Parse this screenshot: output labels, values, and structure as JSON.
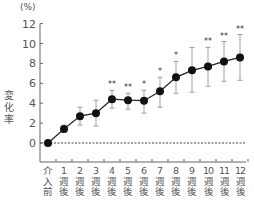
{
  "chart_data": {
    "type": "line",
    "title": "",
    "ylabel": "変化率",
    "yunit": "(%)",
    "xlabel": "",
    "ylim": [
      -1.9,
      12
    ],
    "yticks": [
      0,
      2,
      4,
      6,
      8,
      10,
      12
    ],
    "grid": false,
    "reference_line": {
      "y": 0,
      "style": "dotted"
    },
    "categories": [
      "介入前",
      "1週後",
      "2週後",
      "3週後",
      "4週後",
      "5週後",
      "6週後",
      "7週後",
      "8週後",
      "9週後",
      "10週後",
      "11週後",
      "12週後"
    ],
    "category_labels": [
      {
        "top": "介",
        "mid": "入",
        "bot": "前"
      },
      {
        "top": "1",
        "mid": "週",
        "bot": "後"
      },
      {
        "top": "2",
        "mid": "週",
        "bot": "後"
      },
      {
        "top": "3",
        "mid": "週",
        "bot": "後"
      },
      {
        "top": "4",
        "mid": "週",
        "bot": "後"
      },
      {
        "top": "5",
        "mid": "週",
        "bot": "後"
      },
      {
        "top": "6",
        "mid": "週",
        "bot": "後"
      },
      {
        "top": "7",
        "mid": "週",
        "bot": "後"
      },
      {
        "top": "8",
        "mid": "週",
        "bot": "後"
      },
      {
        "top": "9",
        "mid": "週",
        "bot": "後"
      },
      {
        "top": "10",
        "mid": "週",
        "bot": "後"
      },
      {
        "top": "11",
        "mid": "週",
        "bot": "後"
      },
      {
        "top": "12",
        "mid": "週",
        "bot": "後"
      }
    ],
    "series": [
      {
        "name": "変化率",
        "values": [
          0,
          1.4,
          2.7,
          3.0,
          4.4,
          4.3,
          4.25,
          5.2,
          6.6,
          7.3,
          7.7,
          8.2,
          8.6
        ],
        "error_upper": [
          0,
          1.8,
          3.6,
          4.3,
          5.3,
          5.0,
          5.3,
          6.6,
          8.2,
          9.6,
          9.6,
          10.2,
          10.9
        ],
        "error_lower": [
          0,
          1.1,
          1.8,
          1.7,
          3.5,
          3.4,
          3.0,
          3.6,
          5.0,
          5.1,
          5.7,
          6.2,
          6.3
        ],
        "significance": [
          "",
          "",
          "",
          "",
          "**",
          "**",
          "*",
          "*",
          "*",
          "",
          "**",
          "**",
          "**"
        ]
      }
    ]
  }
}
